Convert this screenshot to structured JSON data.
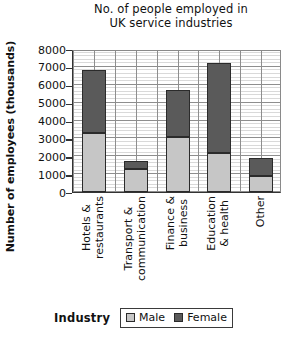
{
  "chart_data": {
    "type": "bar",
    "subtype": "stacked-vertical",
    "title": "No. of people employed in UK service industries",
    "title_lines": [
      "No. of people employed in",
      "UK service industries"
    ],
    "xlabel": "Industry",
    "ylabel": "Number of employees (thousands)",
    "categories": [
      "Hotels & restaurants",
      "Transport & communication",
      "Finance & business",
      "Education & health",
      "Other"
    ],
    "category_lines": [
      [
        "Hotels &",
        "restaurants"
      ],
      [
        "Transport &",
        "communication"
      ],
      [
        "Finance &",
        "business"
      ],
      [
        "Education",
        "& health"
      ],
      [
        "Other"
      ]
    ],
    "series": [
      {
        "name": "Male",
        "color": "#c6c6c6",
        "values": [
          3300,
          1300,
          3100,
          2200,
          900
        ]
      },
      {
        "name": "Female",
        "color": "#5a5a5a",
        "values": [
          3550,
          450,
          2600,
          5000,
          1000
        ]
      }
    ],
    "totals": [
      6850,
      1750,
      5700,
      7200,
      1900
    ],
    "ylim": [
      0,
      8000
    ],
    "ytick_values": [
      0,
      1000,
      2000,
      3000,
      4000,
      5000,
      6000,
      7000,
      8000
    ],
    "ytick_labels": [
      "0",
      "1000",
      "2000",
      "3000",
      "4000",
      "5000",
      "6000",
      "7000",
      "8000"
    ],
    "y_minor_step": 200,
    "grid": "both",
    "legend_position": "bottom",
    "legend_entries": [
      "Male",
      "Female"
    ]
  },
  "legend": {
    "axis_title": "Industry",
    "items": [
      {
        "label": "Male",
        "swatch": "male-swatch"
      },
      {
        "label": "Female",
        "swatch": "female-swatch"
      }
    ]
  }
}
